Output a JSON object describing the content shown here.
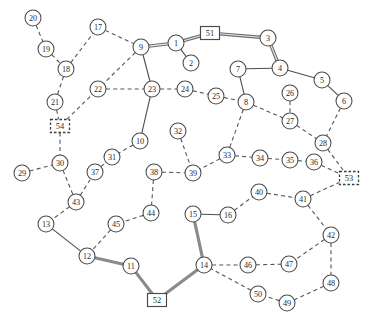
{
  "diagram": {
    "width": 367,
    "height": 321,
    "background_color": "#ffffff",
    "node_fill_color": "#ffffff",
    "node_stroke_color": "#4a4a4a",
    "edge_solid_color": "#4d4d4d",
    "edge_dashed_color": "#555555",
    "edge_road_color": "#8a8a8a"
  },
  "nodes": [
    {
      "id": "1",
      "label": "1",
      "shape": "circle",
      "x": 176,
      "y": 43,
      "r": 8
    },
    {
      "id": "2",
      "label": "2",
      "shape": "circle",
      "x": 191,
      "y": 63,
      "r": 8
    },
    {
      "id": "3",
      "label": "3",
      "shape": "circle",
      "x": 268,
      "y": 38,
      "r": 8
    },
    {
      "id": "4",
      "label": "4",
      "shape": "circle",
      "x": 280,
      "y": 68,
      "r": 8
    },
    {
      "id": "5",
      "label": "5",
      "shape": "circle",
      "x": 322,
      "y": 80,
      "r": 8
    },
    {
      "id": "6",
      "label": "6",
      "shape": "circle",
      "x": 344,
      "y": 101,
      "r": 8
    },
    {
      "id": "7",
      "label": "7",
      "shape": "circle",
      "x": 238,
      "y": 69,
      "r": 8
    },
    {
      "id": "8",
      "label": "8",
      "shape": "circle",
      "x": 246,
      "y": 102,
      "r": 8
    },
    {
      "id": "9",
      "label": "9",
      "shape": "circle",
      "x": 141,
      "y": 47,
      "r": 8
    },
    {
      "id": "10",
      "label": "10",
      "shape": "circle",
      "x": 140,
      "y": 141,
      "r": 8
    },
    {
      "id": "11",
      "label": "11",
      "shape": "circle",
      "x": 131,
      "y": 266,
      "r": 8
    },
    {
      "id": "12",
      "label": "12",
      "shape": "circle",
      "x": 87,
      "y": 256,
      "r": 8
    },
    {
      "id": "13",
      "label": "13",
      "shape": "circle",
      "x": 46,
      "y": 224,
      "r": 8
    },
    {
      "id": "14",
      "label": "14",
      "shape": "circle",
      "x": 204,
      "y": 265,
      "r": 8
    },
    {
      "id": "15",
      "label": "15",
      "shape": "circle",
      "x": 193,
      "y": 214,
      "r": 8
    },
    {
      "id": "16",
      "label": "16",
      "shape": "circle",
      "x": 228,
      "y": 215,
      "r": 8
    },
    {
      "id": "17",
      "label": "17",
      "shape": "circle",
      "x": 98,
      "y": 27,
      "r": 8
    },
    {
      "id": "18",
      "label": "18",
      "shape": "circle",
      "x": 66,
      "y": 69,
      "r": 8
    },
    {
      "id": "19",
      "label": "19",
      "shape": "circle",
      "x": 46,
      "y": 49,
      "r": 8
    },
    {
      "id": "20",
      "label": "20",
      "shape": "circle",
      "x": 33,
      "y": 18,
      "r": 8
    },
    {
      "id": "21",
      "label": "21",
      "shape": "circle",
      "x": 55,
      "y": 102,
      "r": 8
    },
    {
      "id": "22",
      "label": "22",
      "shape": "circle",
      "x": 98,
      "y": 89,
      "r": 8
    },
    {
      "id": "23",
      "label": "23",
      "shape": "circle",
      "x": 152,
      "y": 89,
      "r": 8
    },
    {
      "id": "24",
      "label": "24",
      "shape": "circle",
      "x": 185,
      "y": 89,
      "r": 8
    },
    {
      "id": "25",
      "label": "25",
      "shape": "circle",
      "x": 216,
      "y": 96,
      "r": 8
    },
    {
      "id": "26",
      "label": "26",
      "shape": "circle",
      "x": 290,
      "y": 93,
      "r": 8
    },
    {
      "id": "27",
      "label": "27",
      "shape": "circle",
      "x": 290,
      "y": 121,
      "r": 8
    },
    {
      "id": "28",
      "label": "28",
      "shape": "circle",
      "x": 323,
      "y": 143,
      "r": 8
    },
    {
      "id": "29",
      "label": "29",
      "shape": "circle",
      "x": 22,
      "y": 173,
      "r": 8
    },
    {
      "id": "30",
      "label": "30",
      "shape": "circle",
      "x": 60,
      "y": 163,
      "r": 8
    },
    {
      "id": "31",
      "label": "31",
      "shape": "circle",
      "x": 112,
      "y": 157,
      "r": 8
    },
    {
      "id": "32",
      "label": "32",
      "shape": "circle",
      "x": 178,
      "y": 131,
      "r": 8
    },
    {
      "id": "33",
      "label": "33",
      "shape": "circle",
      "x": 227,
      "y": 155,
      "r": 8
    },
    {
      "id": "34",
      "label": "34",
      "shape": "circle",
      "x": 260,
      "y": 158,
      "r": 8
    },
    {
      "id": "35",
      "label": "35",
      "shape": "circle",
      "x": 290,
      "y": 160,
      "r": 8
    },
    {
      "id": "36",
      "label": "36",
      "shape": "circle",
      "x": 314,
      "y": 162,
      "r": 8
    },
    {
      "id": "37",
      "label": "37",
      "shape": "circle",
      "x": 95,
      "y": 172,
      "r": 8
    },
    {
      "id": "38",
      "label": "38",
      "shape": "circle",
      "x": 154,
      "y": 172,
      "r": 8
    },
    {
      "id": "39",
      "label": "39",
      "shape": "circle",
      "x": 193,
      "y": 173,
      "r": 8
    },
    {
      "id": "40",
      "label": "40",
      "shape": "circle",
      "x": 259,
      "y": 192,
      "r": 8
    },
    {
      "id": "41",
      "label": "41",
      "shape": "circle",
      "x": 303,
      "y": 199,
      "r": 8
    },
    {
      "id": "42",
      "label": "42",
      "shape": "circle",
      "x": 331,
      "y": 235,
      "r": 8
    },
    {
      "id": "43",
      "label": "43",
      "shape": "circle",
      "x": 76,
      "y": 202,
      "r": 8
    },
    {
      "id": "44",
      "label": "44",
      "shape": "circle",
      "x": 151,
      "y": 213,
      "r": 8
    },
    {
      "id": "45",
      "label": "45",
      "shape": "circle",
      "x": 116,
      "y": 224,
      "r": 8
    },
    {
      "id": "46",
      "label": "46",
      "shape": "circle",
      "x": 248,
      "y": 265,
      "r": 8
    },
    {
      "id": "47",
      "label": "47",
      "shape": "circle",
      "x": 289,
      "y": 264,
      "r": 8
    },
    {
      "id": "48",
      "label": "48",
      "shape": "circle",
      "x": 331,
      "y": 283,
      "r": 8
    },
    {
      "id": "49",
      "label": "49",
      "shape": "circle",
      "x": 287,
      "y": 303,
      "r": 8
    },
    {
      "id": "50",
      "label": "50",
      "shape": "circle",
      "x": 258,
      "y": 294,
      "r": 8
    },
    {
      "id": "51",
      "label": "51",
      "shape": "square",
      "x": 210,
      "y": 33,
      "w": 19,
      "h": 13
    },
    {
      "id": "52",
      "label": "52",
      "shape": "square",
      "x": 157,
      "y": 300,
      "w": 19,
      "h": 13
    },
    {
      "id": "53",
      "label": "53",
      "shape": "square-dashed",
      "x": 349,
      "y": 178,
      "w": 19,
      "h": 13
    },
    {
      "id": "54",
      "label": "54",
      "shape": "square-dashed",
      "x": 60,
      "y": 126,
      "w": 19,
      "h": 13
    }
  ],
  "edges": [
    {
      "from": "20",
      "to": "19",
      "style": "dashed"
    },
    {
      "from": "19",
      "to": "18",
      "style": "dashed"
    },
    {
      "from": "18",
      "to": "17",
      "style": "dashed"
    },
    {
      "from": "18",
      "to": "21",
      "style": "dashed"
    },
    {
      "from": "17",
      "to": "9",
      "style": "dashed"
    },
    {
      "from": "21",
      "to": "54",
      "style": "dashed"
    },
    {
      "from": "54",
      "to": "22",
      "style": "dashed"
    },
    {
      "from": "54",
      "to": "30",
      "style": "dashed"
    },
    {
      "from": "9",
      "to": "22",
      "style": "dashed"
    },
    {
      "from": "9",
      "to": "1",
      "style": "double"
    },
    {
      "from": "1",
      "to": "51",
      "style": "double"
    },
    {
      "from": "51",
      "to": "3",
      "style": "double"
    },
    {
      "from": "3",
      "to": "4",
      "style": "double"
    },
    {
      "from": "1",
      "to": "2",
      "style": "solid"
    },
    {
      "from": "4",
      "to": "7",
      "style": "solid"
    },
    {
      "from": "4",
      "to": "5",
      "style": "solid"
    },
    {
      "from": "5",
      "to": "6",
      "style": "solid"
    },
    {
      "from": "7",
      "to": "8",
      "style": "solid"
    },
    {
      "from": "9",
      "to": "23",
      "style": "solid"
    },
    {
      "from": "22",
      "to": "23",
      "style": "dashed"
    },
    {
      "from": "23",
      "to": "24",
      "style": "dashed"
    },
    {
      "from": "24",
      "to": "25",
      "style": "dashed"
    },
    {
      "from": "25",
      "to": "8",
      "style": "dashed"
    },
    {
      "from": "23",
      "to": "10",
      "style": "solid"
    },
    {
      "from": "10",
      "to": "31",
      "style": "dashed"
    },
    {
      "from": "8",
      "to": "27",
      "style": "dashed"
    },
    {
      "from": "26",
      "to": "27",
      "style": "dashed"
    },
    {
      "from": "27",
      "to": "28",
      "style": "dashed"
    },
    {
      "from": "6",
      "to": "28",
      "style": "dashed"
    },
    {
      "from": "28",
      "to": "53",
      "style": "dashed"
    },
    {
      "from": "8",
      "to": "33",
      "style": "dashed"
    },
    {
      "from": "33",
      "to": "34",
      "style": "dashed"
    },
    {
      "from": "34",
      "to": "35",
      "style": "dashed"
    },
    {
      "from": "35",
      "to": "36",
      "style": "dashed"
    },
    {
      "from": "36",
      "to": "53",
      "style": "dashed"
    },
    {
      "from": "33",
      "to": "39",
      "style": "dashed"
    },
    {
      "from": "32",
      "to": "39",
      "style": "dashed"
    },
    {
      "from": "38",
      "to": "39",
      "style": "dashed"
    },
    {
      "from": "38",
      "to": "44",
      "style": "dashed"
    },
    {
      "from": "44",
      "to": "45",
      "style": "dashed"
    },
    {
      "from": "45",
      "to": "12",
      "style": "dashed"
    },
    {
      "from": "29",
      "to": "30",
      "style": "dashed"
    },
    {
      "from": "30",
      "to": "43",
      "style": "dashed"
    },
    {
      "from": "43",
      "to": "37",
      "style": "dashed"
    },
    {
      "from": "37",
      "to": "31",
      "style": "dashed"
    },
    {
      "from": "43",
      "to": "13",
      "style": "dashed"
    },
    {
      "from": "13",
      "to": "12",
      "style": "solid"
    },
    {
      "from": "12",
      "to": "11",
      "style": "road"
    },
    {
      "from": "11",
      "to": "52",
      "style": "road"
    },
    {
      "from": "52",
      "to": "14",
      "style": "road"
    },
    {
      "from": "14",
      "to": "15",
      "style": "road"
    },
    {
      "from": "15",
      "to": "16",
      "style": "solid"
    },
    {
      "from": "16",
      "to": "40",
      "style": "dashed"
    },
    {
      "from": "40",
      "to": "41",
      "style": "dashed"
    },
    {
      "from": "41",
      "to": "53",
      "style": "dashed"
    },
    {
      "from": "41",
      "to": "42",
      "style": "dashed"
    },
    {
      "from": "42",
      "to": "47",
      "style": "dashed"
    },
    {
      "from": "42",
      "to": "48",
      "style": "dashed"
    },
    {
      "from": "48",
      "to": "49",
      "style": "dashed"
    },
    {
      "from": "49",
      "to": "50",
      "style": "dashed"
    },
    {
      "from": "50",
      "to": "14",
      "style": "dashed"
    },
    {
      "from": "14",
      "to": "46",
      "style": "dashed"
    },
    {
      "from": "46",
      "to": "47",
      "style": "dashed"
    }
  ]
}
